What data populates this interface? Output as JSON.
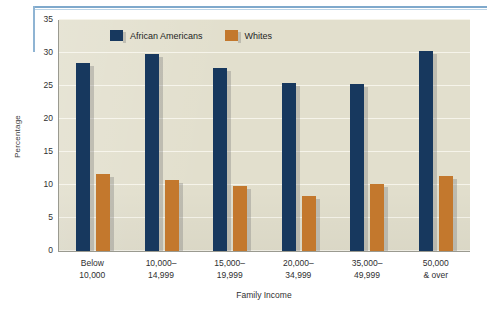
{
  "chart_data": {
    "type": "bar",
    "title": "",
    "xlabel": "Family Income",
    "ylabel": "Percentage",
    "ylim": [
      0,
      35
    ],
    "yticks": [
      0,
      5,
      10,
      15,
      20,
      25,
      30,
      35
    ],
    "ytick_labels": [
      "0",
      "5",
      "10",
      "15",
      "20",
      "25",
      "30",
      "35"
    ],
    "grid": true,
    "legend_position": "top-center",
    "categories": [
      "Below\n10,000",
      "10,000–\n14,999",
      "15,000–\n19,999",
      "20,000–\n34,999",
      "35,000–\n49,999",
      "50,000\n& over"
    ],
    "category_lines": [
      [
        "Below",
        "10,000"
      ],
      [
        "10,000–",
        "14,999"
      ],
      [
        "15,000–",
        "19,999"
      ],
      [
        "20,000–",
        "34,999"
      ],
      [
        "35,000–",
        "49,999"
      ],
      [
        "50,000",
        "& over"
      ]
    ],
    "series": [
      {
        "name": "African Americans",
        "color": "#17385e",
        "values": [
          28.5,
          29.9,
          27.8,
          25.5,
          25.3,
          30.3
        ]
      },
      {
        "name": "Whites",
        "color": "#c3782d",
        "values": [
          11.7,
          10.8,
          9.9,
          8.4,
          10.2,
          11.3
        ]
      }
    ]
  },
  "legend": {
    "items": [
      {
        "label": "African Americans",
        "color": "#17385e"
      },
      {
        "label": "Whites",
        "color": "#c3782d"
      }
    ]
  },
  "axes": {
    "y_title": "Percentage",
    "x_title": "Family Income"
  },
  "colors": {
    "series_navy": "#17385e",
    "series_orange": "#c3782d",
    "plot_background": "#e2dfcd",
    "gridline": "#f6f4ea",
    "rule_blue": "#7fa9cc"
  }
}
